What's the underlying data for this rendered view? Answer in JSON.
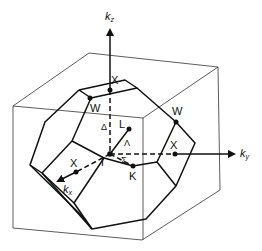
{
  "figure": {
    "axes": {
      "kz": {
        "label": "k",
        "subscript": "z"
      },
      "ky": {
        "label": "k",
        "subscript": "y"
      },
      "kx": {
        "label": "k",
        "subscript": "x"
      }
    },
    "points": {
      "gamma": "Γ",
      "x_top": "X",
      "x_right": "X",
      "x_front": "X",
      "w_left": "W",
      "w_right": "W",
      "l": "L",
      "k": "K"
    },
    "lines": {
      "delta": "Δ",
      "lambda": "Λ",
      "sigma": "Σ"
    }
  }
}
